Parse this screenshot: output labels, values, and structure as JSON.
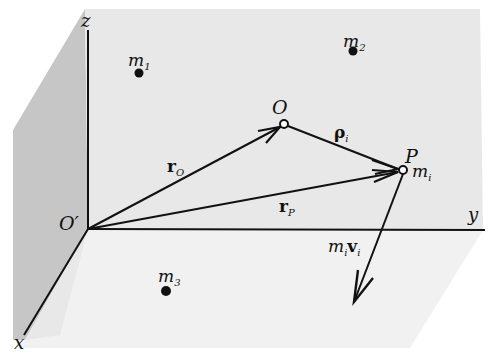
{
  "figure": {
    "colors": {
      "background": "#ffffff",
      "back_wall": "#e9e9e9",
      "side_wall": "#c4c4c4",
      "floor": "#f1f1f1",
      "ink": "#111111"
    }
  },
  "axes": {
    "origin_label": "O′",
    "x_label": "x",
    "y_label": "y",
    "z_label": "z"
  },
  "points": {
    "O": {
      "label": "O"
    },
    "P": {
      "label": "P"
    }
  },
  "masses": [
    {
      "id": "m1",
      "base": "m",
      "sub": "1"
    },
    {
      "id": "m2",
      "base": "m",
      "sub": "2"
    },
    {
      "id": "m3",
      "base": "m",
      "sub": "3"
    },
    {
      "id": "mi",
      "base": "m",
      "sub": "i"
    }
  ],
  "vectors": {
    "r_O": {
      "base": "r",
      "sub": "O"
    },
    "r_P": {
      "base": "r",
      "sub": "P"
    },
    "rho_i": {
      "base": "ρ",
      "sub": "i"
    },
    "momentum": {
      "m_base": "m",
      "m_sub": "i",
      "v_base": "v",
      "v_sub": "i"
    }
  }
}
